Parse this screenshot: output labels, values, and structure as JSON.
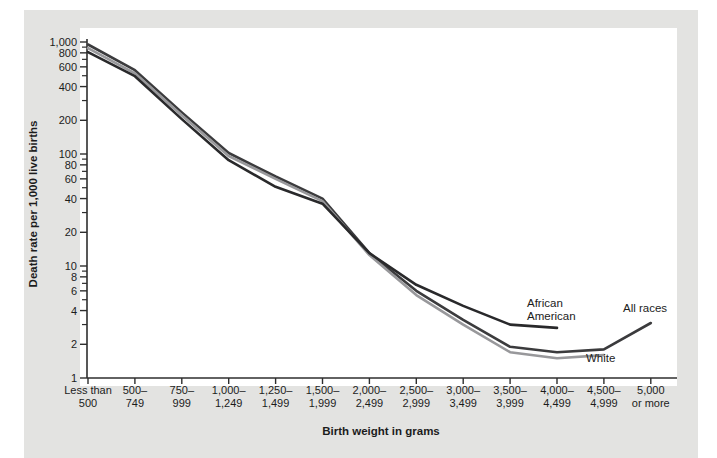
{
  "figure": {
    "background_color": "#e3e3e1",
    "page_color": "#ffffff",
    "axis_color": "#2e2e2e",
    "text_color": "#1c1c1c"
  },
  "chart_data": {
    "type": "line",
    "yscale": "log",
    "ylim": [
      1,
      1000
    ],
    "grid": false,
    "legend": "inline-end-labels",
    "ylabel": "Death rate per 1,000 live births",
    "xlabel": "Birth weight in grams",
    "y_tick_labels": [
      "1,000",
      "800",
      "600",
      "400",
      "200",
      "100",
      "80",
      "60",
      "40",
      "20",
      "10",
      "8",
      "6",
      "4",
      "2",
      "1"
    ],
    "categories": [
      "Less than\n500",
      "500–\n749",
      "750–\n999",
      "1,000–\n1,249",
      "1,250–\n1,499",
      "1,500–\n1,999",
      "2,000–\n2,499",
      "2,500–\n2,999",
      "3,000–\n3,499",
      "3,500–\n3,999",
      "4,000–\n4,499",
      "4,500–\n4,999",
      "5,000\nor more"
    ],
    "series": [
      {
        "name": "All races",
        "color": "#3b3b3d",
        "values": [
          950,
          560,
          235,
          102,
          63,
          40,
          13,
          6,
          3.3,
          1.9,
          1.7,
          1.8,
          3.1
        ]
      },
      {
        "name": "White",
        "color": "#98989b",
        "values": [
          880,
          525,
          222,
          96,
          60,
          38,
          12.5,
          5.5,
          3,
          1.7,
          1.5,
          1.6,
          null
        ]
      },
      {
        "name": "African American",
        "color": "#29292b",
        "values": [
          810,
          495,
          205,
          88,
          51,
          36,
          13,
          6.8,
          4.4,
          3,
          2.8,
          null,
          null
        ]
      }
    ]
  }
}
